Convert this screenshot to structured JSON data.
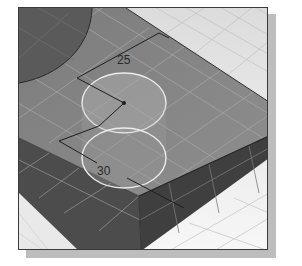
{
  "viewport": {
    "description": "3D CAD isometric viewport",
    "colors": {
      "background_floor": "#f0f0f0",
      "block_top": "#8a8a8a",
      "block_front": "#4a4a4a",
      "block_right": "#3c3c3c",
      "cylinder_dark": "#5e5e5e",
      "circle_highlight": "#e6e6e6",
      "grid_line": "#b8b8b8",
      "dimension_line": "#1e1e1e",
      "frame_border": "#3a3a3a",
      "shadow": "#bdbdbd"
    }
  },
  "dimensions": [
    {
      "id": "dim-25",
      "label": "25"
    },
    {
      "id": "dim-30",
      "label": "30"
    }
  ]
}
